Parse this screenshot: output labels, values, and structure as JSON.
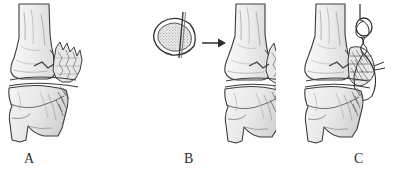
{
  "figure": {
    "background_color": "#ffffff",
    "ink_color": "#3a3a3a",
    "bone_fill_color": "#ececec",
    "bone_shadow_color": "#d6d6d6",
    "cancellous_fill_color": "#e4e4e4",
    "width": 409,
    "height": 177
  },
  "panels": [
    {
      "id": "A",
      "label": "A",
      "caption": "Displaced comminuted medial malleolar fracture of the distal tibia with joint space and talus shown below.",
      "structures": [
        "distal tibia shaft",
        "medial malleolus",
        "comminuted fracture fragments",
        "ankle joint space",
        "talus",
        "calcaneus"
      ]
    },
    {
      "id": "B",
      "label": "B",
      "caption": "Cross-section inset of cancellous bone with transfixing pin, arrow indicating application to the fracture site.",
      "inset": {
        "name": "bone-cross-section",
        "description": "triangular cortical outline with stippled cancellous interior and a vertical pin passing through",
        "has_pin": true
      },
      "arrow": {
        "name": "transfer-arrow",
        "direction": "right"
      },
      "structures": [
        "distal tibia shaft",
        "medial malleolus",
        "comminuted fracture fragments",
        "ankle joint space",
        "talus",
        "calcaneus"
      ]
    },
    {
      "id": "C",
      "label": "C",
      "caption": "Completed repair with tension-band suture loop and wire passing over the reduced fracture fragments.",
      "fixation": {
        "name": "suture-loop-knot",
        "description": "twisted wire loop at proximal end with strands running distally across the fracture"
      },
      "structures": [
        "distal tibia shaft",
        "medial malleolus",
        "reduced fracture fragments",
        "tension-band suture",
        "ankle joint space",
        "talus",
        "calcaneus"
      ]
    }
  ]
}
